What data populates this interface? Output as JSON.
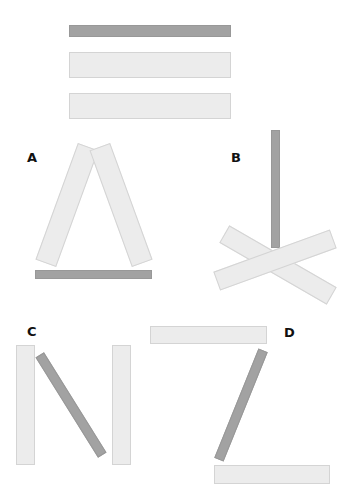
{
  "diagram": {
    "colors": {
      "light_stick": "#ececec",
      "light_border": "#d4d4d4",
      "dark_stick": "#a2a2a2",
      "label": "#111111"
    },
    "legend_group": {
      "sticks": [
        "dark",
        "light",
        "light"
      ]
    },
    "panels": [
      {
        "label": "A",
        "shape": "triangle-like: two light sticks leaning together with dark stick as base"
      },
      {
        "label": "B",
        "shape": "two light sticks crossed in X with dark vertical stick above"
      },
      {
        "label": "C",
        "shape": "N: two vertical light sticks with diagonal dark stick"
      },
      {
        "label": "D",
        "shape": "Z: two horizontal light sticks with diagonal dark stick"
      }
    ]
  }
}
